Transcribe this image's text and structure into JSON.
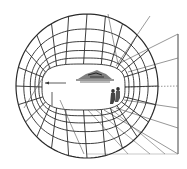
{
  "diagram": {
    "type": "visual-field-grid",
    "colors": {
      "background": "#ffffff",
      "grid_line": "#2a2a2a",
      "projection_line": "#6a6a6a",
      "sketch": "#333333"
    },
    "outer_ellipse": {
      "cx": 87,
      "cy": 86,
      "rx": 71,
      "ry": 72
    },
    "inner_opening": {
      "x": 42,
      "y": 64,
      "width": 83,
      "height": 46,
      "rx": 20
    },
    "rings": 5,
    "spokes": 24,
    "picture_plane": {
      "x": 178,
      "y1": 34,
      "y2": 154
    },
    "projection_targets_y": [
      34,
      58,
      86,
      108,
      128,
      154
    ],
    "labels": []
  }
}
